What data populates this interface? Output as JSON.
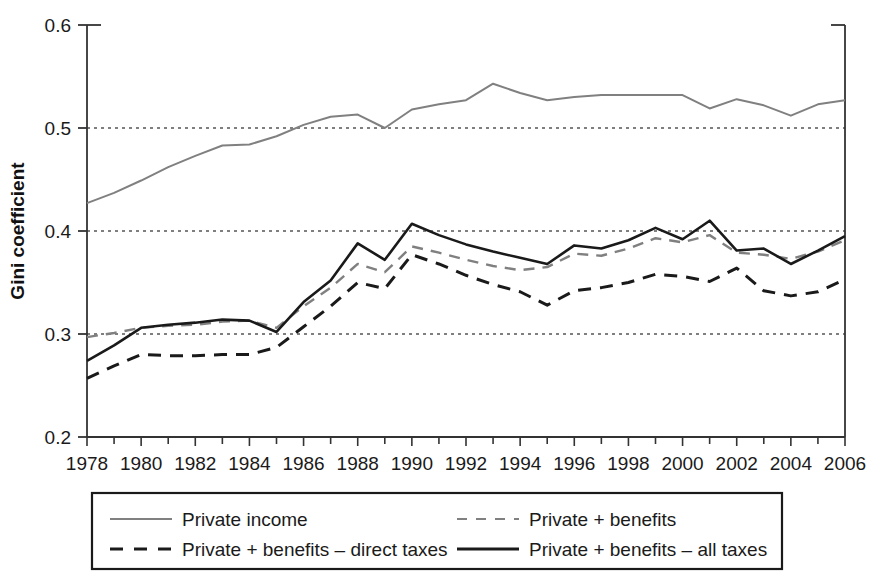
{
  "chart_data": {
    "type": "line",
    "title": "",
    "xlabel": "",
    "ylabel": "Gini coefficient",
    "xlim": [
      1978,
      2006
    ],
    "ylim": [
      0.2,
      0.6
    ],
    "yticks": [
      "0.2",
      "0.3",
      "0.4",
      "0.5",
      "0.6"
    ],
    "ytick_values": [
      0.2,
      0.3,
      0.4,
      0.5,
      0.6
    ],
    "gridlines_y": [
      0.3,
      0.4,
      0.5
    ],
    "grid": "horizontal-dotted",
    "legend_position": "below-plot",
    "x": [
      1978,
      1979,
      1980,
      1981,
      1982,
      1983,
      1984,
      1985,
      1986,
      1987,
      1988,
      1989,
      1990,
      1991,
      1992,
      1993,
      1994,
      1995,
      1996,
      1997,
      1998,
      1999,
      2000,
      2001,
      2002,
      2003,
      2004,
      2005,
      2006
    ],
    "xtick_labels": [
      "1978",
      "1980",
      "1982",
      "1984",
      "1986",
      "1988",
      "1990",
      "1992",
      "1994",
      "1996",
      "1998",
      "2000",
      "2002",
      "2004",
      "2006"
    ],
    "xtick_label_values": [
      1978,
      1980,
      1982,
      1984,
      1986,
      1988,
      1990,
      1992,
      1994,
      1996,
      1998,
      2000,
      2002,
      2004,
      2006
    ],
    "series": [
      {
        "name": "Private income",
        "color": "#808080",
        "style": "solid",
        "width": 2,
        "values": [
          0.427,
          0.437,
          0.449,
          0.462,
          0.473,
          0.483,
          0.484,
          0.492,
          0.503,
          0.511,
          0.513,
          0.5,
          0.518,
          0.523,
          0.527,
          0.543,
          0.534,
          0.527,
          0.53,
          0.532,
          0.532,
          0.532,
          0.532,
          0.519,
          0.528,
          0.522,
          0.512,
          0.523,
          0.527
        ]
      },
      {
        "name": "Private + benefits",
        "color": "#808080",
        "style": "dashed",
        "width": 2.4,
        "values": [
          0.297,
          0.301,
          0.306,
          0.308,
          0.309,
          0.312,
          0.313,
          0.306,
          0.327,
          0.345,
          0.368,
          0.36,
          0.385,
          0.379,
          0.372,
          0.366,
          0.362,
          0.365,
          0.378,
          0.376,
          0.383,
          0.393,
          0.389,
          0.396,
          0.379,
          0.377,
          0.373,
          0.38,
          0.391
        ]
      },
      {
        "name": "Private + benefits – direct taxes",
        "color": "#1a1a1a",
        "style": "dashed",
        "width": 3,
        "values": [
          0.257,
          0.269,
          0.28,
          0.279,
          0.279,
          0.28,
          0.28,
          0.287,
          0.307,
          0.327,
          0.35,
          0.344,
          0.377,
          0.368,
          0.357,
          0.348,
          0.341,
          0.328,
          0.342,
          0.345,
          0.35,
          0.358,
          0.356,
          0.351,
          0.364,
          0.342,
          0.337,
          0.341,
          0.353
        ]
      },
      {
        "name": "Private + benefits – all taxes",
        "color": "#1a1a1a",
        "style": "solid",
        "width": 2.6,
        "values": [
          0.274,
          0.289,
          0.306,
          0.309,
          0.311,
          0.314,
          0.313,
          0.302,
          0.331,
          0.352,
          0.388,
          0.372,
          0.407,
          0.396,
          0.387,
          0.38,
          0.374,
          0.368,
          0.386,
          0.383,
          0.391,
          0.403,
          0.392,
          0.41,
          0.381,
          0.383,
          0.368,
          0.381,
          0.395
        ]
      }
    ],
    "legend_entries": [
      {
        "label": "Private income",
        "color": "#808080",
        "style": "solid"
      },
      {
        "label": "Private + benefits",
        "color": "#808080",
        "style": "dashed"
      },
      {
        "label": "Private + benefits – direct taxes",
        "color": "#1a1a1a",
        "style": "dashed"
      },
      {
        "label": "Private + benefits – all taxes",
        "color": "#1a1a1a",
        "style": "solid"
      }
    ]
  }
}
